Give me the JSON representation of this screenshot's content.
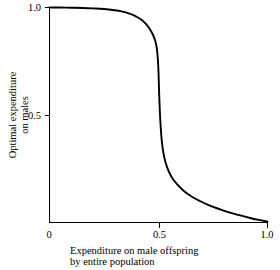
{
  "chart_data": {
    "type": "line",
    "title": "",
    "xlabel": "Expenditure on male offspring by entire population",
    "xlabel_line1": "Expenditure on male offspring",
    "xlabel_line2": "by entire population",
    "ylabel": "Optimal expenditure on males",
    "ylabel_line1": "Optimal expenditure",
    "ylabel_line2": "on males",
    "xlim": [
      0,
      1.0
    ],
    "ylim": [
      0,
      1.0
    ],
    "xticks": [
      0,
      0.5,
      1.0
    ],
    "xtick_labels": [
      "0",
      "0.5",
      "1.0"
    ],
    "yticks": [
      0,
      0.5,
      1.0
    ],
    "ytick_labels": [
      "0",
      "0.5",
      "1.0"
    ],
    "grid": false,
    "legend": false,
    "series": [
      {
        "name": "Optimal expenditure on males",
        "color": "#000000",
        "x": [
          0.0,
          0.05,
          0.1,
          0.15,
          0.2,
          0.25,
          0.3,
          0.33,
          0.36,
          0.39,
          0.42,
          0.44,
          0.46,
          0.475,
          0.485,
          0.492,
          0.497,
          0.5,
          0.503,
          0.508,
          0.515,
          0.525,
          0.54,
          0.56,
          0.585,
          0.615,
          0.65,
          0.69,
          0.73,
          0.775,
          0.82,
          0.87,
          0.92,
          0.96,
          1.0
        ],
        "y": [
          1.0,
          1.0,
          0.999,
          0.998,
          0.996,
          0.993,
          0.987,
          0.982,
          0.974,
          0.962,
          0.944,
          0.926,
          0.9,
          0.872,
          0.845,
          0.812,
          0.76,
          0.7,
          0.6,
          0.48,
          0.38,
          0.31,
          0.255,
          0.212,
          0.178,
          0.148,
          0.122,
          0.1,
          0.081,
          0.064,
          0.048,
          0.034,
          0.021,
          0.012,
          0.004
        ]
      }
    ]
  },
  "axes": {
    "x_tick_0": "0",
    "x_tick_mid": "0.5",
    "x_tick_max": "1.0",
    "y_tick_0": "0",
    "y_tick_mid": "0.5",
    "y_tick_max": "1.0"
  },
  "colors": {
    "curve": "#000000",
    "axis": "#000000",
    "background": "#ffffff"
  }
}
